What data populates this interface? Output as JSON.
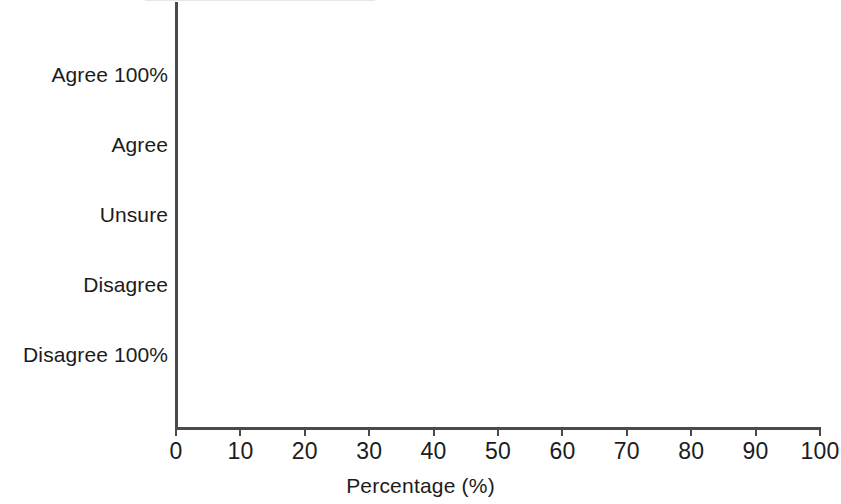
{
  "chart_data": {
    "type": "bar",
    "orientation": "horizontal",
    "title": "",
    "xlabel": "Percentage (%)",
    "ylabel": "",
    "categories": [
      "Agree 100%",
      "Agree",
      "Unsure",
      "Disagree",
      "Disagree 100%"
    ],
    "values": [
      12.7,
      29.3,
      20.8,
      25.0,
      11.5
    ],
    "xlim": [
      0,
      100
    ],
    "xticks": [
      0,
      10,
      20,
      30,
      40,
      50,
      60,
      70,
      80,
      90,
      100
    ],
    "xtick_labels": [
      "0",
      "10",
      "20",
      "30",
      "40",
      "50",
      "60",
      "70",
      "80",
      "90",
      "100"
    ],
    "grid": false,
    "legend": false,
    "bar_color": "#e3e3e3",
    "axis_color": "#4a4a4a",
    "text_color": "#1c1c1c"
  },
  "axis": {
    "x_title": "Percentage (%)"
  }
}
